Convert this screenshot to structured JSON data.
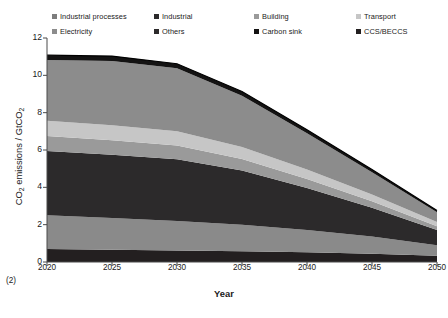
{
  "chart_data": {
    "type": "area",
    "title": "",
    "xlabel": "Year",
    "ylabel": "CO2 emissions / GtCO2",
    "ylabel_parts": {
      "pre": "CO",
      "sub1": "2",
      "mid": " emissions / GtCO",
      "sub2": "2"
    },
    "x": [
      2020,
      2025,
      2030,
      2035,
      2040,
      2045,
      2050
    ],
    "xlim": [
      2020,
      2050
    ],
    "ylim": [
      0,
      12
    ],
    "xticks": [
      "2020",
      "2025",
      "2030",
      "2035",
      "2040",
      "2045",
      "2050"
    ],
    "yticks": [
      "0",
      "2",
      "4",
      "6",
      "8",
      "10",
      "12"
    ],
    "grid": false,
    "legend_position": "top",
    "stacked": true,
    "series": [
      {
        "name": "CCS/BECCS",
        "color": "#231f20",
        "values": [
          0.7,
          0.66,
          0.62,
          0.58,
          0.52,
          0.44,
          0.34
        ]
      },
      {
        "name": "Industrial",
        "color": "#8a8a8a",
        "values": [
          1.8,
          1.7,
          1.58,
          1.42,
          1.2,
          0.92,
          0.56
        ]
      },
      {
        "name": "Others",
        "color": "#2c2a2b",
        "values": [
          3.45,
          3.38,
          3.3,
          2.9,
          2.25,
          1.55,
          0.82
        ]
      },
      {
        "name": "Building",
        "color": "#9a9a9a",
        "values": [
          0.8,
          0.78,
          0.74,
          0.62,
          0.48,
          0.34,
          0.2
        ]
      },
      {
        "name": "Transport",
        "color": "#c6c6c6",
        "values": [
          0.82,
          0.8,
          0.76,
          0.64,
          0.5,
          0.36,
          0.22
        ]
      },
      {
        "name": "Electricity",
        "color": "#8c8c8c",
        "values": [
          3.25,
          3.45,
          3.38,
          2.75,
          1.95,
          1.2,
          0.52
        ]
      },
      {
        "name": "Industrial processes",
        "color": "#7d7d7d",
        "values": [
          0.0,
          0.0,
          0.0,
          0.0,
          0.0,
          0.0,
          0.0
        ]
      },
      {
        "name": "Carbon sink",
        "color": "#141313",
        "values": [
          0.26,
          0.26,
          0.24,
          0.22,
          0.18,
          0.14,
          0.1
        ]
      }
    ],
    "totals": [
      11.08,
      11.03,
      10.62,
      9.13,
      7.08,
      4.95,
      2.76
    ]
  },
  "legend": {
    "items": [
      {
        "label": "Industrial processes",
        "color": "#7d7d7d",
        "icon": "legend-swatch"
      },
      {
        "label": "Industrial",
        "color": "#2c2a2b",
        "icon": "legend-swatch"
      },
      {
        "label": "Building",
        "color": "#9a9a9a",
        "icon": "legend-swatch"
      },
      {
        "label": "Transport",
        "color": "#c6c6c6",
        "icon": "legend-swatch"
      },
      {
        "label": "Electricity",
        "color": "#8c8c8c",
        "icon": "legend-swatch"
      },
      {
        "label": "Others",
        "color": "#2c2a2b",
        "icon": "legend-swatch"
      },
      {
        "label": "Carbon sink",
        "color": "#141313",
        "icon": "legend-swatch"
      },
      {
        "label": "CCS/BECCS",
        "color": "#231f20",
        "icon": "legend-swatch"
      }
    ]
  },
  "axis": {
    "y_ticks": [
      "12",
      "10",
      "8",
      "6",
      "4",
      "2",
      "0"
    ],
    "x_ticks": [
      "2020",
      "2025",
      "2030",
      "2035",
      "2040",
      "2045",
      "2050"
    ],
    "x_title": "Year"
  },
  "annotations": {
    "corner_note": "(2)"
  }
}
